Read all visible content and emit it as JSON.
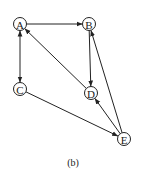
{
  "diagram": {
    "caption": "(b)",
    "nodes": [
      {
        "id": "A",
        "label": "A",
        "x": 20,
        "y": 24
      },
      {
        "id": "B",
        "label": "B",
        "x": 89,
        "y": 24
      },
      {
        "id": "C",
        "label": "C",
        "x": 20,
        "y": 89
      },
      {
        "id": "D",
        "label": "D",
        "x": 91,
        "y": 93
      },
      {
        "id": "E",
        "label": "E",
        "x": 124,
        "y": 139
      }
    ],
    "edges": [
      {
        "from": "A",
        "to": "B",
        "bidirectional": false
      },
      {
        "from": "A",
        "to": "C",
        "bidirectional": true
      },
      {
        "from": "B",
        "to": "D",
        "bidirectional": false
      },
      {
        "from": "D",
        "to": "A",
        "bidirectional": false
      },
      {
        "from": "C",
        "to": "E",
        "bidirectional": false
      },
      {
        "from": "E",
        "to": "D",
        "bidirectional": false
      },
      {
        "from": "E",
        "to": "B",
        "bidirectional": false
      }
    ]
  }
}
